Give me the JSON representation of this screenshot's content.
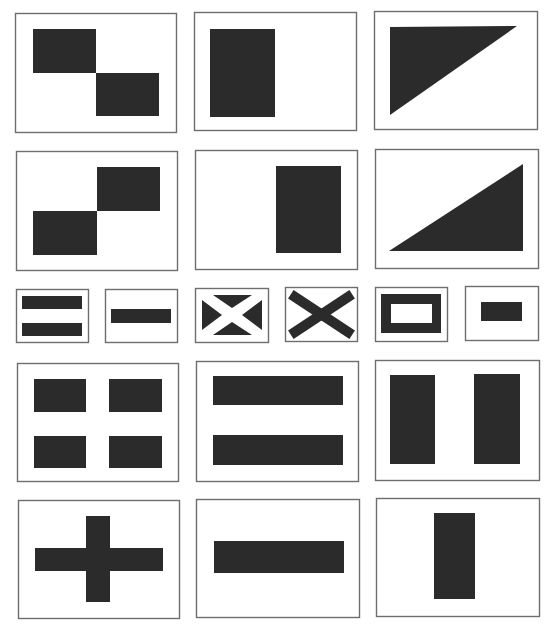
{
  "colors": {
    "background": "#ffffff",
    "frame": "#6e6e6e",
    "fill": "#2b2b2b"
  },
  "panels": [
    {
      "id": "two-squares-diagonal-down",
      "box": [
        15,
        13,
        161,
        119
      ],
      "shapes": [
        {
          "type": "rect",
          "x": 33,
          "y": 29,
          "w": 63,
          "h": 44
        },
        {
          "type": "rect",
          "x": 96,
          "y": 73,
          "w": 63,
          "h": 43
        }
      ]
    },
    {
      "id": "vertical-block-left",
      "box": [
        194,
        12,
        162,
        118
      ],
      "shapes": [
        {
          "type": "rect",
          "x": 210,
          "y": 29,
          "w": 65,
          "h": 88
        }
      ]
    },
    {
      "id": "triangle-top-left",
      "box": [
        374,
        11,
        163,
        118
      ],
      "shapes": [
        {
          "type": "poly",
          "points": "390,27 517,26 390,115"
        }
      ]
    },
    {
      "id": "two-squares-diagonal-up",
      "box": [
        16,
        151,
        161,
        119
      ],
      "shapes": [
        {
          "type": "rect",
          "x": 97,
          "y": 167,
          "w": 63,
          "h": 44
        },
        {
          "type": "rect",
          "x": 33,
          "y": 211,
          "w": 64,
          "h": 44
        }
      ]
    },
    {
      "id": "vertical-block-right",
      "box": [
        195,
        150,
        162,
        119
      ],
      "shapes": [
        {
          "type": "rect",
          "x": 276,
          "y": 166,
          "w": 65,
          "h": 87
        }
      ]
    },
    {
      "id": "triangle-bottom-right",
      "box": [
        375,
        149,
        163,
        119
      ],
      "shapes": [
        {
          "type": "poly",
          "points": "389,251 523,164 523,251"
        }
      ]
    },
    {
      "id": "small-two-bars",
      "box": [
        16,
        289,
        72,
        53
      ],
      "shapes": [
        {
          "type": "rect",
          "x": 22,
          "y": 296,
          "w": 60,
          "h": 13
        },
        {
          "type": "rect",
          "x": 22,
          "y": 323,
          "w": 60,
          "h": 13
        }
      ]
    },
    {
      "id": "small-one-bar",
      "box": [
        105,
        289,
        72,
        53
      ],
      "shapes": [
        {
          "type": "rect",
          "x": 111,
          "y": 309,
          "w": 60,
          "h": 14
        }
      ]
    },
    {
      "id": "small-saltire-white",
      "box": [
        195,
        288,
        73,
        54
      ],
      "shapes": [
        {
          "type": "poly",
          "points": "213,295 252,295 232,308"
        },
        {
          "type": "poly",
          "points": "202,300 222,315 202,330"
        },
        {
          "type": "poly",
          "points": "262,300 242,315 262,330"
        },
        {
          "type": "poly",
          "points": "213,335 232,322 252,335"
        }
      ]
    },
    {
      "id": "small-saltire-dark",
      "box": [
        285,
        287,
        72,
        54
      ],
      "shapes": [
        {
          "type": "line",
          "x1": 295,
          "y1": 297,
          "x2": 348,
          "y2": 332,
          "w": 10
        },
        {
          "type": "line",
          "x1": 348,
          "y1": 297,
          "x2": 295,
          "y2": 332,
          "w": 10
        }
      ]
    },
    {
      "id": "small-frame",
      "box": [
        375,
        287,
        72,
        54
      ],
      "shapes": [
        {
          "type": "rect",
          "x": 381,
          "y": 294,
          "w": 60,
          "h": 39
        },
        {
          "type": "hole",
          "x": 391,
          "y": 304,
          "w": 41,
          "h": 19
        }
      ]
    },
    {
      "id": "small-center-block",
      "box": [
        465,
        286,
        73,
        54
      ],
      "shapes": [
        {
          "type": "rect",
          "x": 481,
          "y": 302,
          "w": 41,
          "h": 19
        }
      ]
    },
    {
      "id": "four-blocks",
      "box": [
        17,
        363,
        161,
        118
      ],
      "shapes": [
        {
          "type": "rect",
          "x": 34,
          "y": 379,
          "w": 52,
          "h": 33
        },
        {
          "type": "rect",
          "x": 109,
          "y": 379,
          "w": 53,
          "h": 33
        },
        {
          "type": "rect",
          "x": 34,
          "y": 436,
          "w": 52,
          "h": 32
        },
        {
          "type": "rect",
          "x": 109,
          "y": 436,
          "w": 53,
          "h": 32
        }
      ]
    },
    {
      "id": "two-horizontal-bars",
      "box": [
        196,
        361,
        162,
        120
      ],
      "shapes": [
        {
          "type": "rect",
          "x": 213,
          "y": 376,
          "w": 130,
          "h": 29
        },
        {
          "type": "rect",
          "x": 213,
          "y": 435,
          "w": 130,
          "h": 30
        }
      ]
    },
    {
      "id": "two-vertical-bars",
      "box": [
        375,
        360,
        164,
        120
      ],
      "shapes": [
        {
          "type": "rect",
          "x": 390,
          "y": 375,
          "w": 45,
          "h": 89
        },
        {
          "type": "rect",
          "x": 474,
          "y": 374,
          "w": 46,
          "h": 90
        }
      ]
    },
    {
      "id": "cross",
      "box": [
        18,
        500,
        161,
        118
      ],
      "shapes": [
        {
          "type": "rect",
          "x": 35,
          "y": 548,
          "w": 128,
          "h": 23
        },
        {
          "type": "rect",
          "x": 86,
          "y": 516,
          "w": 24,
          "h": 86
        }
      ]
    },
    {
      "id": "single-horizontal-bar",
      "box": [
        196,
        499,
        163,
        118
      ],
      "shapes": [
        {
          "type": "rect",
          "x": 214,
          "y": 541,
          "w": 130,
          "h": 32
        }
      ]
    },
    {
      "id": "single-vertical-bar",
      "box": [
        376,
        498,
        163,
        118
      ],
      "shapes": [
        {
          "type": "rect",
          "x": 434,
          "y": 513,
          "w": 41,
          "h": 86
        }
      ]
    }
  ]
}
